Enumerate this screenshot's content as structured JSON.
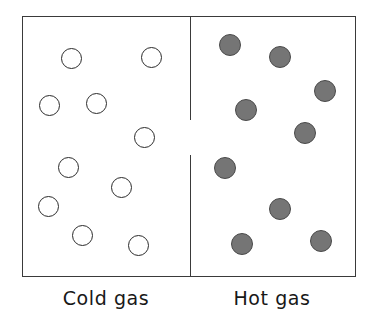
{
  "figure": {
    "width": 372,
    "height": 327,
    "background_color": "#ffffff"
  },
  "container": {
    "name": "gas-container",
    "x": 22,
    "y": 16,
    "width": 334,
    "height": 261,
    "stroke_color": "#3a3a3a",
    "fill_color": "#ffffff"
  },
  "divider": {
    "name": "container-divider",
    "x": 190,
    "stroke_color": "#3a3a3a",
    "segments": [
      {
        "y": 16,
        "height": 104
      },
      {
        "y": 155,
        "height": 122
      }
    ]
  },
  "chart_data": {
    "type": "scatter",
    "xlabel": "",
    "ylabel": "",
    "xlim": [
      22,
      356
    ],
    "ylim": [
      16,
      277
    ],
    "grid": false,
    "legend": "none",
    "series": [
      {
        "name": "Cold gas",
        "marker": "open-circle",
        "fill": "#ffffff",
        "stroke": "#2b2b2b",
        "radius": 10.5,
        "count": 10,
        "points": [
          {
            "x": 71,
            "y": 58
          },
          {
            "x": 151,
            "y": 57
          },
          {
            "x": 49,
            "y": 105
          },
          {
            "x": 96,
            "y": 103
          },
          {
            "x": 144,
            "y": 137
          },
          {
            "x": 68,
            "y": 167
          },
          {
            "x": 121,
            "y": 187
          },
          {
            "x": 48,
            "y": 206
          },
          {
            "x": 82,
            "y": 235
          },
          {
            "x": 138,
            "y": 245
          }
        ]
      },
      {
        "name": "Hot gas",
        "marker": "filled-circle",
        "fill": "#757575",
        "stroke": "#4a4a4a",
        "radius": 11,
        "count": 9,
        "points": [
          {
            "x": 230,
            "y": 45
          },
          {
            "x": 280,
            "y": 57
          },
          {
            "x": 325,
            "y": 91
          },
          {
            "x": 246,
            "y": 110
          },
          {
            "x": 305,
            "y": 133
          },
          {
            "x": 225,
            "y": 168
          },
          {
            "x": 280,
            "y": 209
          },
          {
            "x": 242,
            "y": 244
          },
          {
            "x": 321,
            "y": 241
          }
        ]
      }
    ]
  },
  "captions": [
    {
      "name": "cold-gas-label",
      "text": "Cold gas",
      "center_x": 106,
      "y": 287
    },
    {
      "name": "hot-gas-label",
      "text": "Hot gas",
      "center_x": 272,
      "y": 287
    }
  ]
}
